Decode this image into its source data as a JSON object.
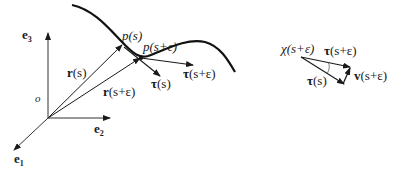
{
  "left_figure": {
    "axes": {
      "origin_label": "o",
      "e1": {
        "base": "e",
        "sub": "1"
      },
      "e2": {
        "base": "e",
        "sub": "2"
      },
      "e3": {
        "base": "e",
        "sub": "3"
      }
    },
    "points": {
      "p_s": "p(s)",
      "p_s_eps": "p(s+ε)"
    },
    "vectors": {
      "r_s": {
        "bold": "r",
        "rest": "(s)"
      },
      "r_s_eps": {
        "bold": "r",
        "rest": "(s+ε)"
      },
      "tau_s": {
        "bold": "τ",
        "rest": "(s)"
      },
      "tau_s_eps": {
        "bold": "τ",
        "rest": "(s+ε)"
      }
    }
  },
  "right_figure": {
    "angle_label": "χ(s+ε)",
    "tau_s_eps": {
      "bold": "τ",
      "rest": "(s+ε)"
    },
    "tau_s": {
      "bold": "τ",
      "rest": "(s)"
    },
    "v_s_eps": {
      "bold": "v",
      "rest": "(s+ε)"
    }
  },
  "colors": {
    "stroke": "#1a1a1a",
    "axis": "#333333"
  }
}
